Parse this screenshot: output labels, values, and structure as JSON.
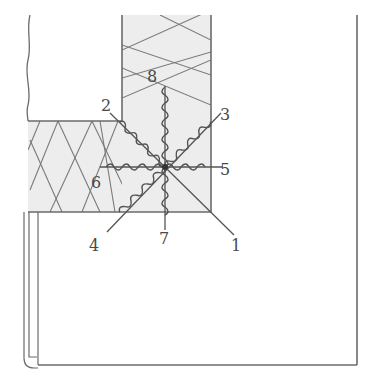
{
  "diagram": {
    "colors": {
      "line": "#6b6b6b",
      "insulation_fill": "#ededed",
      "background": "#ffffff",
      "label": "#4a4a4a"
    },
    "labels": [
      {
        "id": "1",
        "text": "1"
      },
      {
        "id": "2",
        "text": "2"
      },
      {
        "id": "3",
        "text": "3"
      },
      {
        "id": "4",
        "text": "4"
      },
      {
        "id": "5",
        "text": "5"
      },
      {
        "id": "6",
        "text": "6"
      },
      {
        "id": "7",
        "text": "7"
      },
      {
        "id": "8",
        "text": "8"
      }
    ]
  }
}
